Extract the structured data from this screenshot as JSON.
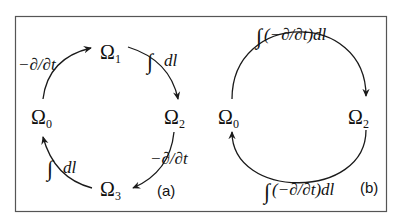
{
  "figure": {
    "panel_a": {
      "label": "(a)",
      "nodes": [
        {
          "id": "omega1",
          "symbol": "Ω",
          "sub": "1"
        },
        {
          "id": "omega2",
          "symbol": "Ω",
          "sub": "2"
        },
        {
          "id": "omega3",
          "symbol": "Ω",
          "sub": "3"
        },
        {
          "id": "omega0",
          "symbol": "Ω",
          "sub": "0"
        }
      ],
      "edges": [
        {
          "from": "omega0",
          "to": "omega1",
          "label": "−∂/∂t"
        },
        {
          "from": "omega1",
          "to": "omega2",
          "label_int": "∫",
          "label": "dl"
        },
        {
          "from": "omega2",
          "to": "omega3",
          "label": "−∂/∂t"
        },
        {
          "from": "omega3",
          "to": "omega0",
          "label_int": "∫",
          "label": "dl"
        }
      ]
    },
    "panel_b": {
      "label": "(b)",
      "nodes": [
        {
          "id": "omega0",
          "symbol": "Ω",
          "sub": "0"
        },
        {
          "id": "omega2",
          "symbol": "Ω",
          "sub": "2"
        }
      ],
      "edges": [
        {
          "from": "omega0",
          "to": "omega2",
          "label_int": "∫",
          "label": "(−∂/∂t)dl"
        },
        {
          "from": "omega2",
          "to": "omega0",
          "label_int": "∫",
          "label": "(−∂/∂t)dl"
        }
      ]
    }
  }
}
